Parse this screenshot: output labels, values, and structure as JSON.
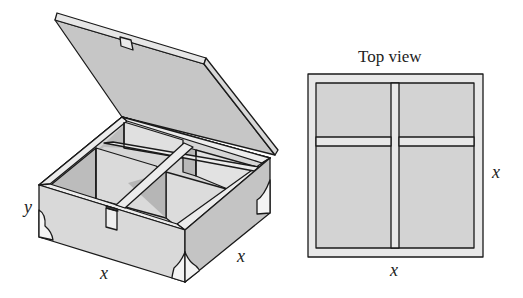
{
  "figure": {
    "type": "box-with-lid-and-dividers",
    "colors": {
      "stroke": "#1a1a1a",
      "face_light": "#e2e2e2",
      "face_mid": "#cfcfcf",
      "face_dark": "#bdbdbd",
      "lid_inner": "#c6c6c6",
      "rim": "#ececec",
      "corner_guard": "#f4f4f4"
    }
  },
  "perspective_view": {
    "labels": {
      "height": "y",
      "front_width": "x",
      "side_depth": "x"
    }
  },
  "top_view": {
    "title": "Top view",
    "labels": {
      "side": "x",
      "bottom": "x"
    }
  }
}
